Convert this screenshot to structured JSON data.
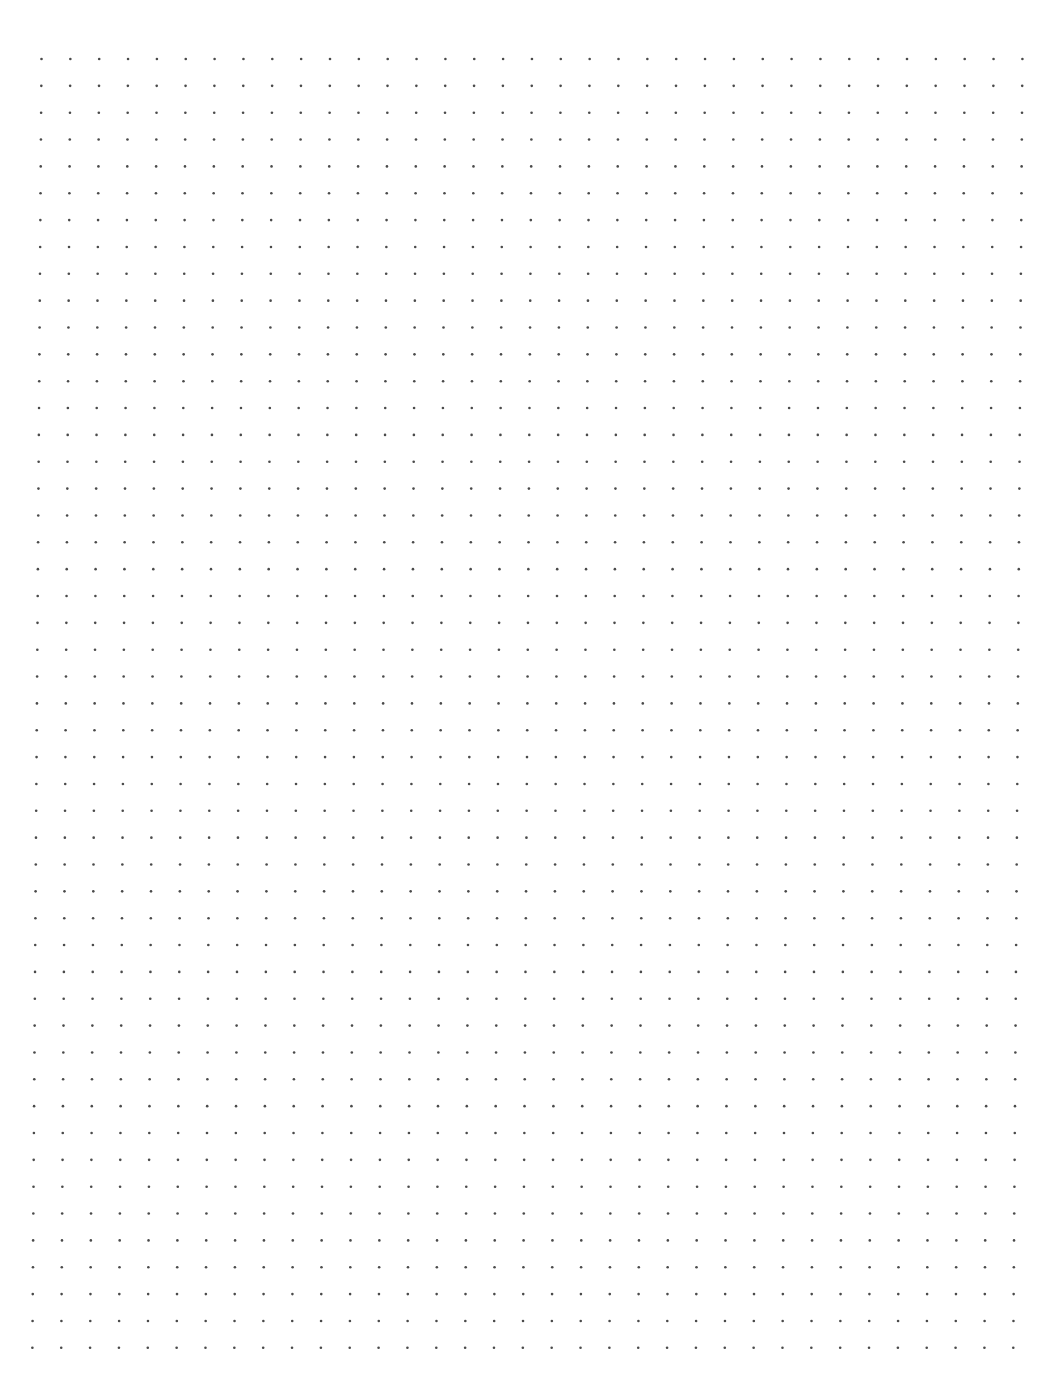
{
  "document": {
    "type": "dot-grid paper",
    "title": ""
  },
  "grid": {
    "columns": 35,
    "rows": 49,
    "origin_top_left": {
      "x": 41.5,
      "y": 59
    },
    "col_pitch": 28.85,
    "row_pitch": 26.85,
    "x_drift_per_row": -0.19,
    "dot_radius": 1.3,
    "dot_color": "#4a4a4a",
    "background_color": "#ffffff"
  }
}
